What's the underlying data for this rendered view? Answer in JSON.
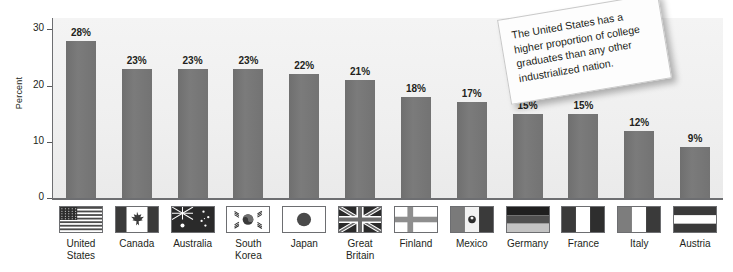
{
  "chart_data": {
    "type": "bar",
    "title": "",
    "xlabel": "",
    "ylabel": "Percent",
    "ylim": [
      0,
      32
    ],
    "yticks": [
      0,
      10,
      20,
      30
    ],
    "ytick_labels": [
      "0",
      "10",
      "20",
      "30"
    ],
    "grid": false,
    "legend": "none",
    "value_suffix": "%",
    "categories": [
      "United\nStates",
      "Canada",
      "Australia",
      "South\nKorea",
      "Japan",
      "Great\nBritain",
      "Finland",
      "Mexico",
      "Germany",
      "France",
      "Italy",
      "Austria"
    ],
    "values": [
      28,
      23,
      23,
      23,
      22,
      21,
      18,
      17,
      15,
      15,
      12,
      9
    ],
    "value_labels": [
      "28%",
      "23%",
      "23%",
      "23%",
      "22%",
      "21%",
      "18%",
      "17%",
      "15%",
      "15%",
      "12%",
      "9%"
    ],
    "flags": [
      "flag-united-states",
      "flag-canada",
      "flag-australia",
      "flag-south-korea",
      "flag-japan",
      "flag-great-britain",
      "flag-finland",
      "flag-mexico",
      "flag-germany",
      "flag-france",
      "flag-italy",
      "flag-austria"
    ],
    "colors": {
      "bar": "#757575",
      "plot_background": "#f0f0f0",
      "axis": "#6d6e71",
      "text": "#231f20",
      "note_background": "#fdfdfd",
      "note_border": "#c8c8c8"
    }
  },
  "annotation": {
    "text": "The United States has a higher proportion of college graduates than any other industrialized nation."
  }
}
